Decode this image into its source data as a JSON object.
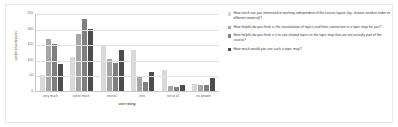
{
  "chart_data": {
    "type": "bar",
    "title": "",
    "xlabel": "user rating",
    "ylabel": "number of participants",
    "ylim": [
      0,
      250
    ],
    "yticks": [
      250,
      200,
      150,
      100,
      50,
      0
    ],
    "grid": true,
    "legend_position": "right",
    "categories": [
      "very much",
      "rather much",
      "neutral",
      "less",
      "not at all",
      "no answer"
    ],
    "series": [
      {
        "name": "How much are you interested in working independent of the course layout (eg. choose another order or different material)?",
        "color": "#d9d9d9",
        "values": [
          52,
          108,
          148,
          133,
          68,
          23
        ]
      },
      {
        "name": "How helpful do you think is the visualization of topics and their connection in a topic map for you?",
        "color": "#a6a6a6",
        "values": [
          168,
          182,
          104,
          45,
          16,
          19
        ]
      },
      {
        "name": "How helpful do you think is it to see related topics in the topic map that are not actually part of the course?",
        "color": "#7f7f7f",
        "values": [
          152,
          232,
          90,
          30,
          12,
          19
        ]
      },
      {
        "name": "How much would you use such a topic map?",
        "color": "#4d4d4d",
        "values": [
          88,
          200,
          133,
          62,
          20,
          42
        ]
      }
    ]
  }
}
